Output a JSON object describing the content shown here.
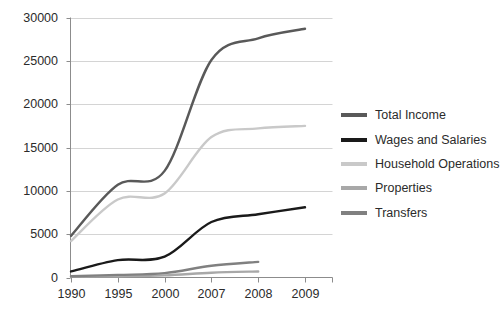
{
  "chart_data": {
    "type": "line",
    "title": "",
    "xlabel": "",
    "ylabel": "",
    "x": [
      1990,
      1995,
      2000,
      2007,
      2008,
      2009
    ],
    "categories": [
      "1990",
      "1995",
      "2000",
      "2007",
      "2008",
      "2009"
    ],
    "xtick_labels": [
      "1990",
      "1995",
      "2000",
      "2007",
      "2008",
      "2009"
    ],
    "ytick_labels": [
      "0",
      "5000",
      "10000",
      "15000",
      "20000",
      "25000",
      "30000"
    ],
    "ytick_values": [
      0,
      5000,
      10000,
      15000,
      20000,
      25000,
      30000
    ],
    "ylim": [
      0,
      30000
    ],
    "grid": "horizontal",
    "legend_position": "right",
    "series": [
      {
        "name": "Total Income",
        "color": "#595959",
        "values": [
          4800,
          10700,
          12300,
          25100,
          27600,
          28700
        ]
      },
      {
        "name": "Wages and Salaries",
        "color": "#1a1a1a",
        "values": [
          700,
          2000,
          2400,
          6400,
          7300,
          8100
        ]
      },
      {
        "name": "Household Operations",
        "color": "#c9c9c9",
        "values": [
          4200,
          9000,
          9700,
          16200,
          17200,
          17500
        ]
      },
      {
        "name": "Properties",
        "color": "#a8a8a8",
        "values": [
          100,
          150,
          250,
          550,
          700,
          null
        ]
      },
      {
        "name": "Transfers",
        "color": "#808080",
        "values": [
          150,
          300,
          500,
          1350,
          1800,
          null
        ]
      }
    ]
  },
  "legend": {
    "items": [
      {
        "label": "Total Income",
        "color": "#595959"
      },
      {
        "label": "Wages and Salaries",
        "color": "#1a1a1a"
      },
      {
        "label": "Household Operations",
        "color": "#c9c9c9"
      },
      {
        "label": "Properties",
        "color": "#a8a8a8"
      },
      {
        "label": "Transfers",
        "color": "#808080"
      }
    ]
  },
  "axes": {
    "axis_color": "#8c8c8c",
    "grid_color": "#d4d4d4",
    "tick_text_color": "#2b2b2b"
  }
}
